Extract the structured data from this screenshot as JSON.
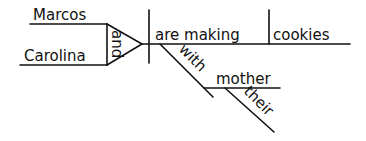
{
  "diagram": {
    "type": "sentence-diagram",
    "subjects": [
      "Marcos",
      "Carolina"
    ],
    "conjunction": "and",
    "verb": "are making",
    "direct_object": "cookies",
    "preposition": "with",
    "object_of_preposition": "mother",
    "modifier": "their",
    "ink_color": "#111111",
    "background_color": "#ffffff"
  }
}
